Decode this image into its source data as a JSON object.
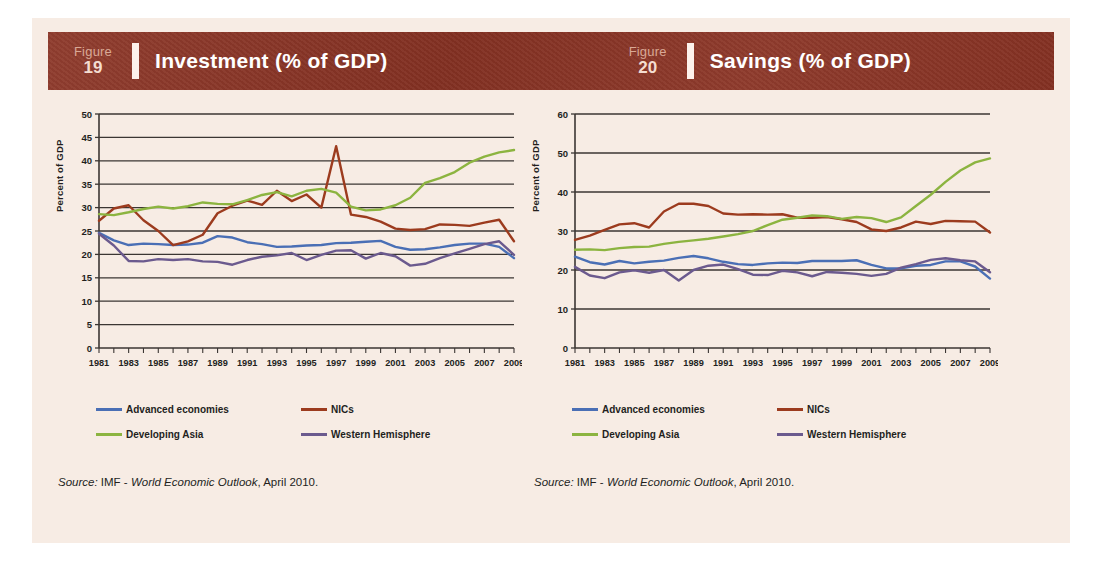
{
  "page": {
    "background": "#f7ece4",
    "band_color": "#8a3324"
  },
  "figures": [
    {
      "figure_word": "Figure",
      "figure_number": "19",
      "title": "Investment (% of GDP)",
      "source_label": "Source:",
      "source_org": "IMF -",
      "source_pub": "World Economic Outlook",
      "source_date": ", April 2010."
    },
    {
      "figure_word": "Figure",
      "figure_number": "20",
      "title": "Savings (% of GDP)",
      "source_label": "Source:",
      "source_org": "IMF -",
      "source_pub": "World Economic Outlook",
      "source_date": ", April 2010."
    }
  ],
  "legend": {
    "items": [
      {
        "label": "Advanced economies",
        "color": "#4a6fb5"
      },
      {
        "label": "NICs",
        "color": "#9c3b1e"
      },
      {
        "label": "Developing Asia",
        "color": "#8cb440"
      },
      {
        "label": "Western Hemisphere",
        "color": "#6b5a8e"
      }
    ]
  },
  "chart_data": [
    {
      "type": "line",
      "title": "Investment (% of GDP)",
      "xlabel": "",
      "ylabel": "Percent of GDP",
      "ylim": [
        0,
        50
      ],
      "ytick_step": 5,
      "yticks": [
        0,
        5,
        10,
        15,
        20,
        25,
        30,
        35,
        40,
        45,
        50
      ],
      "grid": true,
      "legend_position": "below",
      "x": [
        1981,
        1982,
        1983,
        1984,
        1985,
        1986,
        1987,
        1988,
        1989,
        1990,
        1991,
        1992,
        1993,
        1994,
        1995,
        1996,
        1997,
        1998,
        1999,
        2000,
        2001,
        2002,
        2003,
        2004,
        2005,
        2006,
        2007,
        2008,
        2009
      ],
      "xtick_labels": [
        "1981",
        "1983",
        "1985",
        "1987",
        "1989",
        "1991",
        "1993",
        "1995",
        "1997",
        "1999",
        "2001",
        "2003",
        "2005",
        "2007",
        "2009"
      ],
      "series": [
        {
          "name": "Advanced economies",
          "color": "#4a6fb5",
          "values": [
            24.6,
            23.0,
            22.0,
            22.3,
            22.2,
            22.0,
            22.1,
            22.5,
            23.9,
            23.6,
            22.6,
            22.2,
            21.6,
            21.7,
            21.9,
            22.0,
            22.4,
            22.5,
            22.7,
            22.9,
            21.6,
            21.0,
            21.1,
            21.5,
            22.0,
            22.3,
            22.3,
            21.6,
            19.2
          ]
        },
        {
          "name": "NICs",
          "color": "#9c3b1e",
          "values": [
            27.2,
            29.8,
            30.5,
            27.3,
            25.0,
            22.0,
            22.8,
            24.2,
            28.8,
            30.4,
            31.5,
            30.6,
            33.6,
            31.4,
            32.8,
            30.0,
            43.1,
            28.5,
            28.0,
            27.0,
            25.5,
            25.2,
            25.4,
            26.4,
            26.3,
            26.1,
            26.8,
            27.4,
            22.8
          ]
        },
        {
          "name": "Developing Asia",
          "color": "#8cb440",
          "values": [
            28.6,
            28.4,
            29.0,
            29.7,
            30.2,
            29.8,
            30.3,
            31.1,
            30.8,
            30.7,
            31.6,
            32.7,
            33.3,
            32.4,
            33.6,
            34.0,
            33.2,
            30.2,
            29.4,
            29.6,
            30.5,
            32.1,
            35.3,
            36.3,
            37.6,
            39.6,
            40.9,
            41.8,
            42.3
          ]
        },
        {
          "name": "Western Hemisphere",
          "color": "#6b5a8e",
          "values": [
            24.4,
            21.9,
            18.6,
            18.5,
            19.0,
            18.8,
            19.0,
            18.5,
            18.4,
            17.8,
            18.8,
            19.5,
            19.8,
            20.3,
            18.8,
            19.9,
            20.8,
            20.9,
            19.1,
            20.3,
            19.6,
            17.6,
            18.0,
            19.2,
            20.2,
            21.2,
            22.2,
            22.8,
            19.9
          ]
        }
      ]
    },
    {
      "type": "line",
      "title": "Savings (% of GDP)",
      "xlabel": "",
      "ylabel": "Percent of GDP",
      "ylim": [
        0,
        60
      ],
      "ytick_step": 10,
      "yticks": [
        0,
        10,
        20,
        30,
        40,
        50,
        60
      ],
      "grid": true,
      "legend_position": "below",
      "x": [
        1981,
        1982,
        1983,
        1984,
        1985,
        1986,
        1987,
        1988,
        1989,
        1990,
        1991,
        1992,
        1993,
        1994,
        1995,
        1996,
        1997,
        1998,
        1999,
        2000,
        2001,
        2002,
        2003,
        2004,
        2005,
        2006,
        2007,
        2008,
        2009
      ],
      "xtick_labels": [
        "1981",
        "1983",
        "1985",
        "1987",
        "1989",
        "1991",
        "1993",
        "1995",
        "1997",
        "1999",
        "2001",
        "2003",
        "2005",
        "2007",
        "2009"
      ],
      "series": [
        {
          "name": "Advanced economies",
          "color": "#4a6fb5",
          "values": [
            23.4,
            22.0,
            21.4,
            22.3,
            21.7,
            22.1,
            22.4,
            23.1,
            23.6,
            23.0,
            22.1,
            21.5,
            21.3,
            21.7,
            21.9,
            21.8,
            22.3,
            22.3,
            22.3,
            22.5,
            21.3,
            20.4,
            20.4,
            21.1,
            21.3,
            22.2,
            22.2,
            20.9,
            17.8
          ]
        },
        {
          "name": "NICs",
          "color": "#9c3b1e",
          "values": [
            27.7,
            28.8,
            30.3,
            31.7,
            32.0,
            30.9,
            35.0,
            37.0,
            37.0,
            36.4,
            34.5,
            34.2,
            34.3,
            34.2,
            34.3,
            33.4,
            33.4,
            33.6,
            33.0,
            32.3,
            30.4,
            30.0,
            30.9,
            32.4,
            31.8,
            32.6,
            32.5,
            32.4,
            29.6
          ]
        },
        {
          "name": "Developing Asia",
          "color": "#8cb440",
          "values": [
            25.2,
            25.3,
            25.1,
            25.6,
            25.9,
            26.0,
            26.7,
            27.2,
            27.6,
            28.0,
            28.6,
            29.2,
            30.0,
            31.5,
            32.9,
            33.4,
            34.0,
            33.8,
            33.1,
            33.6,
            33.3,
            32.3,
            33.5,
            36.4,
            39.3,
            42.6,
            45.5,
            47.6,
            48.6
          ]
        },
        {
          "name": "Western Hemisphere",
          "color": "#6b5a8e",
          "values": [
            20.8,
            18.6,
            17.9,
            19.4,
            19.9,
            19.3,
            20.0,
            17.3,
            20.0,
            21.1,
            21.4,
            20.2,
            18.8,
            18.7,
            19.8,
            19.4,
            18.4,
            19.5,
            19.3,
            19.0,
            18.5,
            19.0,
            20.6,
            21.5,
            22.6,
            23.0,
            22.5,
            22.2,
            19.4
          ]
        }
      ]
    }
  ]
}
